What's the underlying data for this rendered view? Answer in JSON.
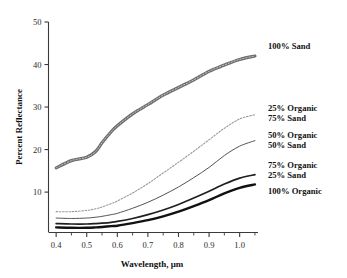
{
  "chart_data": {
    "type": "line",
    "title": "",
    "xlabel": "Wavelength, μm",
    "ylabel": "Percent Reflectance",
    "xlim": [
      0.375,
      1.06
    ],
    "ylim": [
      0.5,
      50
    ],
    "grid": false,
    "legend_position": "right-inline",
    "xticks": [
      "0.4",
      "0.5",
      "0.6",
      "0.7",
      "0.8",
      "0.9",
      "1.0"
    ],
    "xtick_values": [
      0.4,
      0.5,
      0.6,
      0.7,
      0.8,
      0.9,
      1.0
    ],
    "yticks": [
      "10",
      "20",
      "30",
      "40",
      "50"
    ],
    "ytick_values": [
      10,
      20,
      30,
      40,
      50
    ],
    "x": [
      0.4,
      0.45,
      0.5,
      0.53,
      0.55,
      0.58,
      0.6,
      0.65,
      0.7,
      0.75,
      0.8,
      0.85,
      0.9,
      0.95,
      1.0,
      1.05
    ],
    "series": [
      {
        "name": "100% Sand",
        "label_line1": "100% Sand",
        "label_line2": "",
        "style": "thick-gray-textured",
        "color": "#6e6e6e",
        "width": 3.2,
        "dash": "none",
        "values": [
          15.7,
          17.4,
          18.2,
          19.6,
          21.6,
          24.2,
          25.6,
          28.4,
          30.6,
          32.8,
          34.6,
          36.4,
          38.4,
          39.9,
          41.2,
          42.0
        ]
      },
      {
        "name": "25% Organic 75% Sand",
        "label_line1": "25% Organic",
        "label_line2": "75% Sand",
        "style": "dotted-light",
        "color": "#9a9a9a",
        "width": 1.1,
        "dash": "1.6 1.6",
        "values": [
          5.4,
          5.4,
          5.7,
          6.1,
          6.5,
          7.3,
          7.9,
          9.8,
          12.0,
          14.5,
          17.0,
          19.6,
          22.3,
          25.0,
          27.2,
          28.2
        ]
      },
      {
        "name": "50% Organic 50% Sand",
        "label_line1": "50% Organic",
        "label_line2": "50% Sand",
        "style": "thin-solid",
        "color": "#4a4a4a",
        "width": 0.95,
        "dash": "none",
        "values": [
          3.9,
          3.8,
          3.9,
          4.1,
          4.3,
          4.7,
          5.0,
          6.2,
          7.6,
          9.3,
          11.2,
          13.4,
          15.8,
          18.6,
          20.8,
          22.1
        ]
      },
      {
        "name": "75% Organic 25% Sand",
        "label_line1": "75% Organic",
        "label_line2": "25% Sand",
        "style": "medium-solid",
        "color": "#1f1f1f",
        "width": 1.7,
        "dash": "none",
        "values": [
          2.6,
          2.5,
          2.5,
          2.6,
          2.7,
          2.9,
          3.1,
          3.8,
          4.7,
          5.8,
          7.1,
          8.6,
          10.2,
          11.9,
          13.3,
          14.1
        ]
      },
      {
        "name": "100% Organic",
        "label_line1": "100% Organic",
        "label_line2": "",
        "style": "thick-solid",
        "color": "#111111",
        "width": 2.4,
        "dash": "none",
        "values": [
          1.7,
          1.6,
          1.6,
          1.7,
          1.8,
          2.0,
          2.1,
          2.7,
          3.4,
          4.3,
          5.4,
          6.7,
          8.1,
          9.7,
          11.0,
          11.8
        ]
      }
    ],
    "annotations": [
      {
        "text": "100% Sand",
        "x": 1.06,
        "y": 42.0
      },
      {
        "text": "25% Organic",
        "x": 1.06,
        "y": 30.5
      },
      {
        "text": "75% Sand",
        "x": 1.06,
        "y": 28.2
      },
      {
        "text": "50% Organic",
        "x": 1.06,
        "y": 23.6
      },
      {
        "text": "50% Sand",
        "x": 1.06,
        "y": 21.4
      },
      {
        "text": "75% Organic",
        "x": 1.06,
        "y": 16.2
      },
      {
        "text": "25% Sand",
        "x": 1.06,
        "y": 14.2
      },
      {
        "text": "100% Organic",
        "x": 1.06,
        "y": 11.6
      }
    ]
  },
  "labels": {
    "y_axis_title": "Percent Reflectance",
    "x_axis_title": "Wavelength, μm",
    "x_tick_0": "0.4",
    "x_tick_1": "0.5",
    "x_tick_2": "0.6",
    "x_tick_3": "0.7",
    "x_tick_4": "0.8",
    "x_tick_5": "0.9",
    "x_tick_6": "1.0",
    "y_tick_0": "10",
    "y_tick_1": "20",
    "y_tick_2": "30",
    "y_tick_3": "40",
    "y_tick_4": "50",
    "series_0_l1": "100% Sand",
    "series_1_l1": "25% Organic",
    "series_1_l2": "75% Sand",
    "series_2_l1": "50% Organic",
    "series_2_l2": "50% Sand",
    "series_3_l1": "75% Organic",
    "series_3_l2": "25% Sand",
    "series_4_l1": "100% Organic"
  }
}
